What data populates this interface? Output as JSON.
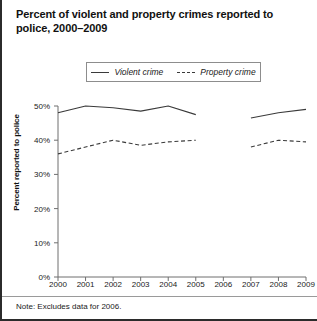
{
  "title": "Percent of violent and property crimes reported to police, 2000–2009",
  "note": "Note: Excludes data for 2006.",
  "axes": {
    "ylabel": "Percent reported to police",
    "yticks": [
      "0%",
      "10%",
      "20%",
      "30%",
      "40%",
      "50%"
    ],
    "xticks": [
      "2000",
      "2001",
      "2002",
      "2003",
      "2004",
      "2005",
      "2006",
      "2007",
      "2008",
      "2009"
    ]
  },
  "legend": {
    "violent": "Violent crime",
    "property": "Property crime"
  },
  "colors": {
    "line": "#3a3a3a",
    "axis": "#6f6f6f",
    "text": "#1a1a1a",
    "border": "#2b2b2b"
  },
  "chart_data": {
    "type": "line",
    "title": "Percent of violent and property crimes reported to police, 2000–2009",
    "xlabel": "",
    "ylabel": "Percent reported to police",
    "x": [
      2000,
      2001,
      2002,
      2003,
      2004,
      2005,
      2006,
      2007,
      2008,
      2009
    ],
    "ylim": [
      0,
      50
    ],
    "ytick_values": [
      0,
      10,
      20,
      30,
      40,
      50
    ],
    "grid": false,
    "legend_position": "top-center",
    "annotations": [
      "Note: Excludes data for 2006."
    ],
    "series": [
      {
        "name": "Violent crime",
        "style": "solid",
        "values": [
          48,
          50,
          49.5,
          48.5,
          50,
          47.5,
          null,
          46.5,
          48,
          49
        ]
      },
      {
        "name": "Property crime",
        "style": "dashed",
        "values": [
          36,
          38,
          40,
          38.5,
          39.5,
          40,
          null,
          38,
          40,
          39.5
        ]
      }
    ]
  }
}
